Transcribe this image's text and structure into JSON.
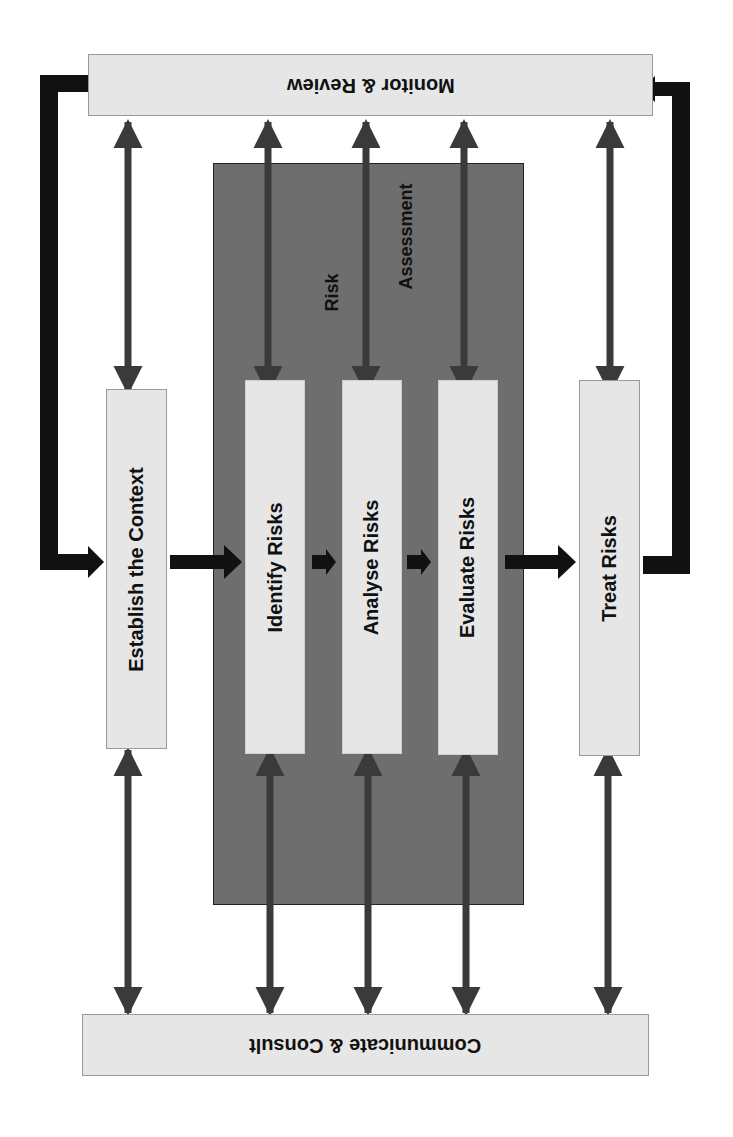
{
  "diagram": {
    "monitor_review": {
      "label": "Monitor & Review"
    },
    "communicate_consult": {
      "label": "Communicate  & Consult"
    },
    "establish_context": {
      "label": "Establish the Context"
    },
    "risk_assessment": {
      "label_line1": "Risk",
      "label_line2": "Assessment",
      "steps": [
        {
          "label": "Identify Risks"
        },
        {
          "label": "Analyse Risks"
        },
        {
          "label": "Evaluate Risks"
        }
      ]
    },
    "treat_risks": {
      "label": "Treat Risks"
    },
    "colors": {
      "box_fill": "#e6e6e6",
      "assessment_fill": "#6e6e6e",
      "arrow_fill": "#3a3a3a",
      "flow_arrow": "#111111"
    }
  }
}
